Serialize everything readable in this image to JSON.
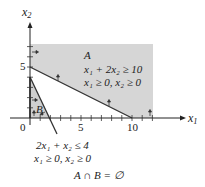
{
  "axes": {
    "x_label": "x",
    "x_label_sub": "1",
    "y_label": "x",
    "y_label_sub": "2",
    "x_ticks": [
      "0",
      "5",
      "10"
    ],
    "y_ticks": [
      "5"
    ]
  },
  "region_a": {
    "name": "A",
    "constraint_1": "x₁ + 2x₂ ≥ 10",
    "constraint_2": "x₁ ≥ 0, x₂ ≥ 0",
    "fill": "#d6d6d6"
  },
  "region_b": {
    "name": "B",
    "constraint_1": "2x₁ + x₂ ≤ 4",
    "constraint_2": "x₁ ≥ 0, x₂ ≥ 0",
    "fill": "#c8c8c8"
  },
  "caption": "A ∩ B = ∅",
  "colors": {
    "line": "#333333",
    "axis": "#222222"
  }
}
